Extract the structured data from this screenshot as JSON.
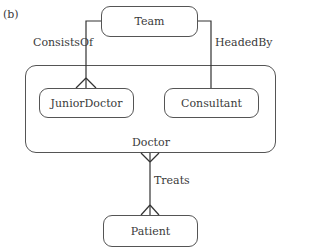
{
  "figure_label": "(b)",
  "entities": {
    "team": "Team",
    "doctor": "Doctor",
    "junior_doctor": "JuniorDoctor",
    "consultant": "Consultant",
    "patient": "Patient"
  },
  "relationships": {
    "consists_of": "ConsistsOf",
    "headed_by": "HeadedBy",
    "treats": "Treats"
  },
  "colors": {
    "line": "#333333",
    "text": "#3a3a3a",
    "background": "#ffffff"
  }
}
